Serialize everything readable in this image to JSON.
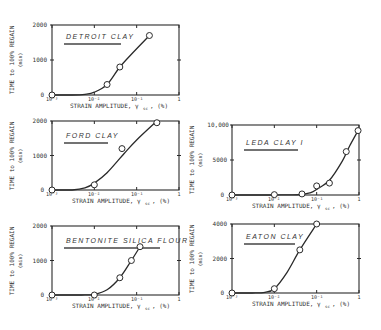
{
  "figure": {
    "background": "#ffffff",
    "ink_color": "#2a2a2a"
  },
  "chart_data": [
    {
      "type": "line",
      "panel_id": "detroit",
      "title": "DETROIT CLAY",
      "xlabel": "STRAIN AMPLITUDE, γ_sc, (%)",
      "ylabel": "TIME to 100% REGAIN (min)",
      "xscale": "log",
      "xlim": [
        0.001,
        1
      ],
      "ylim": [
        0,
        2000
      ],
      "xticks": [
        "10⁻³",
        "10⁻²",
        "10⁻¹",
        "1"
      ],
      "yticks": [
        "0",
        "1000",
        "2000"
      ],
      "grid": false,
      "x": [
        0.001,
        0.02,
        0.04,
        0.2
      ],
      "values": [
        0,
        300,
        800,
        1700
      ],
      "curve_x": [
        0.001,
        0.003,
        0.006,
        0.01,
        0.02,
        0.04,
        0.08,
        0.2
      ],
      "curve_y": [
        0,
        0,
        20,
        80,
        300,
        800,
        1200,
        1700
      ]
    },
    {
      "type": "line",
      "panel_id": "ford",
      "title": "FORD CLAY",
      "xlabel": "STRAIN AMPLITUDE, γ_sc, (%)",
      "ylabel": "TIME to 100% REGAIN (min)",
      "xscale": "log",
      "xlim": [
        0.001,
        1
      ],
      "ylim": [
        0,
        2000
      ],
      "xticks": [
        "10⁻³",
        "10⁻²",
        "10⁻¹",
        "1"
      ],
      "yticks": [
        "0",
        "1000",
        "2000"
      ],
      "grid": false,
      "x": [
        0.001,
        0.01,
        0.045,
        0.3
      ],
      "values": [
        0,
        150,
        1200,
        1950
      ],
      "curve_x": [
        0.001,
        0.003,
        0.006,
        0.01,
        0.02,
        0.05,
        0.1,
        0.3
      ],
      "curve_y": [
        0,
        0,
        60,
        200,
        500,
        1050,
        1450,
        2000
      ]
    },
    {
      "type": "line",
      "panel_id": "bentonite",
      "title": "BENTONITE SILICA FLOUR",
      "xlabel": "STRAIN AMPLITUDE, γ_sc, (%)",
      "ylabel": "TIME to 100% REGAIN (min)",
      "xscale": "log",
      "xlim": [
        0.001,
        1
      ],
      "ylim": [
        0,
        2000
      ],
      "xticks": [
        "10⁻³",
        "10⁻²",
        "10⁻¹",
        "1"
      ],
      "yticks": [
        "0",
        "1000",
        "2000"
      ],
      "grid": false,
      "x": [
        0.001,
        0.01,
        0.04,
        0.075,
        0.12
      ],
      "values": [
        0,
        0,
        500,
        1000,
        1400
      ],
      "curve_x": [
        0.001,
        0.005,
        0.01,
        0.02,
        0.04,
        0.075,
        0.12
      ],
      "curve_y": [
        0,
        0,
        20,
        150,
        500,
        1000,
        1400
      ]
    },
    {
      "type": "line",
      "panel_id": "leda",
      "title": "LEDA CLAY I",
      "xlabel": "STRAIN AMPLITUDE, γ_sc, (%)",
      "ylabel": "TIME to 100% REGAIN (min)",
      "xscale": "log",
      "xlim": [
        0.001,
        1
      ],
      "ylim": [
        0,
        10000
      ],
      "xticks": [
        "10⁻³",
        "10⁻²",
        "10⁻¹",
        "1"
      ],
      "yticks": [
        "0",
        "5000",
        "10,000"
      ],
      "grid": false,
      "x": [
        0.001,
        0.01,
        0.045,
        0.1,
        0.2,
        0.5,
        0.95
      ],
      "values": [
        0,
        50,
        150,
        1300,
        1700,
        6200,
        9200
      ],
      "curve_x": [
        0.001,
        0.01,
        0.04,
        0.07,
        0.1,
        0.2,
        0.4,
        0.6,
        0.95
      ],
      "curve_y": [
        0,
        0,
        50,
        300,
        800,
        2100,
        4800,
        7000,
        9200
      ]
    },
    {
      "type": "line",
      "panel_id": "eaton",
      "title": "EATON CLAY",
      "xlabel": "STRAIN AMPLITUDE, γ_sc, (%)",
      "ylabel": "TIME to 100% REGAIN (min)",
      "xscale": "log",
      "xlim": [
        0.001,
        1
      ],
      "ylim": [
        0,
        4000
      ],
      "xticks": [
        "10⁻³",
        "10⁻²",
        "10⁻¹",
        "1"
      ],
      "yticks": [
        "0",
        "2000",
        "4000"
      ],
      "grid": false,
      "x": [
        0.001,
        0.01,
        0.04,
        0.1
      ],
      "values": [
        0,
        250,
        2500,
        4000
      ],
      "curve_x": [
        0.001,
        0.003,
        0.006,
        0.01,
        0.02,
        0.04,
        0.1
      ],
      "curve_y": [
        0,
        0,
        40,
        250,
        1200,
        2500,
        4000
      ]
    }
  ],
  "panels": {
    "detroit": {
      "title": "DETROIT CLAY",
      "ylabel_line1": "TIME to 100% REGAIN",
      "ylabel_line2": "(min)",
      "xlabel": "STRAIN  AMPLITUDE, γ",
      "xlabel_sub": "sc",
      "xlabel_unit": ", (%)",
      "yticks": [
        "2000",
        "1000",
        "0"
      ],
      "xticks": [
        "10⁻³",
        "10⁻²",
        "10⁻¹",
        "1"
      ]
    },
    "ford": {
      "title": "FORD CLAY",
      "ylabel_line1": "TIME to 100% REGAIN",
      "ylabel_line2": "(min)",
      "xlabel": "STRAIN  AMPLITUDE, γ",
      "xlabel_sub": "sc",
      "xlabel_unit": ", (%)",
      "yticks": [
        "2000",
        "1000",
        "0"
      ],
      "xticks": [
        "10⁻³",
        "10⁻²",
        "10⁻¹",
        "1"
      ]
    },
    "bentonite": {
      "title": "BENTONITE SILICA FLOUR",
      "ylabel_line1": "TIME to 100% REGAIN",
      "ylabel_line2": "(min)",
      "xlabel": "STRAIN  AMPLITUDE, γ",
      "xlabel_sub": "sc",
      "xlabel_unit": ", (%)",
      "yticks": [
        "2000",
        "1000",
        "0"
      ],
      "xticks": [
        "10⁻³",
        "10⁻²",
        "10⁻¹",
        "1"
      ]
    },
    "leda": {
      "title": "LEDA CLAY I",
      "ylabel_line1": "TIME to 100% REGAIN",
      "ylabel_line2": "(min)",
      "xlabel": "STRAIN  AMPLITUDE, γ",
      "xlabel_sub": "sc",
      "xlabel_unit": ", (%)",
      "yticks": [
        "10,000",
        "5000",
        "0"
      ],
      "xticks": [
        "10⁻³",
        "10⁻²",
        "10⁻¹",
        "1"
      ]
    },
    "eaton": {
      "title": "EATON CLAY",
      "ylabel_line1": "TIME to 100% REGAIN",
      "ylabel_line2": "(min)",
      "xlabel": "STRAIN  AMPLITUDE, γ",
      "xlabel_sub": "sc",
      "xlabel_unit": ", (%)",
      "yticks": [
        "4000",
        "2000",
        "0"
      ],
      "xticks": [
        "10⁻³",
        "10⁻²",
        "10⁻¹",
        "1"
      ]
    }
  }
}
